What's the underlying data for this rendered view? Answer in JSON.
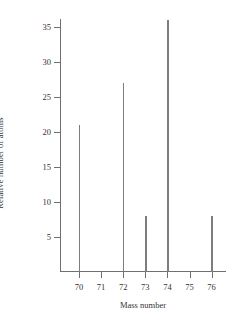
{
  "chart_data": {
    "type": "bar",
    "title": "",
    "xlabel": "Mass number",
    "ylabel": "Relative number of atoms",
    "categories": [
      "70",
      "71",
      "72",
      "73",
      "74",
      "75",
      "76"
    ],
    "values": [
      21,
      0,
      27,
      8,
      36,
      0,
      8
    ],
    "xtick_labels": [
      "70",
      "71",
      "72",
      "73",
      "74",
      "75",
      "76"
    ],
    "ytick_labels": [
      "5",
      "10",
      "15",
      "20",
      "25",
      "30",
      "35"
    ],
    "ytick_values": [
      5,
      10,
      15,
      20,
      25,
      30,
      35
    ],
    "ylim": [
      0,
      37
    ],
    "xlim": [
      69.3,
      76.7
    ],
    "grid": false,
    "legend": false,
    "bar_color": "#7d7d7d",
    "axis_color": "#6f6f6f",
    "background_color": "#ffffff"
  },
  "axes": {
    "y_title": "Relative number of atoms",
    "x_title": "Mass number"
  }
}
